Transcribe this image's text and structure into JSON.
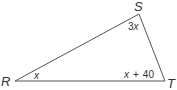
{
  "diagram": {
    "type": "triangle",
    "stroke_color": "#555555",
    "vertices": [
      {
        "name": "R",
        "x": 15,
        "y": 81
      },
      {
        "name": "S",
        "x": 139,
        "y": 14
      },
      {
        "name": "T",
        "x": 165,
        "y": 81
      }
    ],
    "labels": {
      "R": "R",
      "S": "S",
      "T": "T"
    },
    "angles": {
      "R": {
        "coef": "",
        "var": "x"
      },
      "S": {
        "coef": "3",
        "var": "x"
      },
      "T": {
        "var": "x",
        "op": "+",
        "const": "40"
      }
    }
  }
}
